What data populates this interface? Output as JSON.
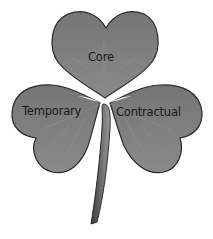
{
  "diagram": {
    "type": "shamrock",
    "leaves": [
      {
        "id": "core",
        "label": "Core"
      },
      {
        "id": "temporary",
        "label": "Temporary"
      },
      {
        "id": "contractual",
        "label": "Contractual"
      }
    ],
    "colors": {
      "leaf_fill": "#7a7a7a",
      "leaf_outline": "#2a2a2a",
      "vein": "#8e8e8e",
      "stem": "#555555",
      "label": "#1a1a1a",
      "background": "#ffffff"
    }
  }
}
